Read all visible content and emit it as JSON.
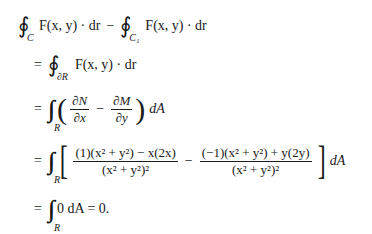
{
  "document": {
    "lines": [
      {
        "id": "line1",
        "oint1_sub": "C",
        "term1": "F(x, y) · dr",
        "minus": "−",
        "oint2_sub": "C₁",
        "term2": "F(x, y) · dr"
      },
      {
        "id": "line2",
        "eq": "=",
        "oint_sub": "∂R",
        "term": "F(x, y) · dr"
      },
      {
        "id": "line3",
        "eq": "=",
        "iint_sub": "R",
        "frac1_num": "∂N",
        "frac1_den": "∂x",
        "minus": "−",
        "frac2_num": "∂M",
        "frac2_den": "∂y",
        "tail": "dA"
      },
      {
        "id": "line4",
        "eq": "=",
        "iint_sub": "R",
        "frac1_num": "(1)(x² + y²) − x(2x)",
        "frac1_den": "(x² + y²)²",
        "minus": "−",
        "frac2_num": "(−1)(x² + y²) + y(2y)",
        "frac2_den": "(x² + y²)²",
        "tail": "dA"
      },
      {
        "id": "line5",
        "eq": "=",
        "iint_sub": "R",
        "tail": "0 dA = 0."
      }
    ]
  }
}
